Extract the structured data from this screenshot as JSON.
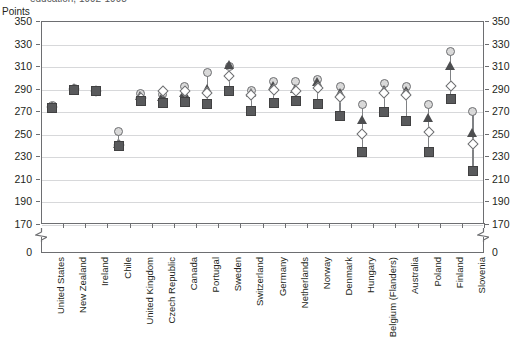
{
  "title": "education, 1992-1998",
  "axis_unit_label": "Points",
  "chart_data": {
    "type": "scatter",
    "title": "education, 1992-1998",
    "subtitle": "",
    "xlabel": "",
    "ylabel": "Points",
    "ylim": [
      170,
      350
    ],
    "yticks": [
      350,
      330,
      310,
      290,
      270,
      250,
      230,
      210,
      190,
      170
    ],
    "y_axis_break": true,
    "y_axis_zero_label": "0",
    "grid": true,
    "legend_position": "none",
    "right_axis_mirrored": true,
    "marker_styles": [
      "circle",
      "triangle",
      "diamond",
      "square"
    ],
    "categories": [
      "United States",
      "New Zealand",
      "Ireland",
      "Chile",
      "United Kingdom",
      "Czech Republic",
      "Canada",
      "Portugal",
      "Sweden",
      "Switzerland",
      "Germany",
      "Netherlands",
      "Norway",
      "Denmark",
      "Hungary",
      "Belgium (Flanders)",
      "Australia",
      "Poland",
      "Finland",
      "Slovenia"
    ],
    "series": [
      {
        "name": "Series 1",
        "marker": "circle",
        "values": [
          275,
          290,
          288,
          252,
          286,
          285,
          292,
          304,
          310,
          288,
          296,
          296,
          298,
          292,
          276,
          295,
          292,
          276,
          323,
          270
        ]
      },
      {
        "name": "Series 2",
        "marker": "triangle",
        "values": [
          274,
          290,
          288,
          241,
          284,
          283,
          286,
          290,
          311,
          286,
          293,
          290,
          296,
          286,
          262,
          289,
          288,
          264,
          310,
          251
        ]
      },
      {
        "name": "Series 3",
        "marker": "diamond",
        "values": [
          274,
          290,
          288,
          240,
          282,
          288,
          288,
          286,
          301,
          284,
          289,
          288,
          291,
          283,
          250,
          286,
          284,
          252,
          292,
          241
        ]
      },
      {
        "name": "Series 4",
        "marker": "square",
        "values": [
          273,
          289,
          288,
          239,
          279,
          277,
          278,
          276,
          288,
          270,
          277,
          279,
          276,
          266,
          234,
          269,
          261,
          234,
          281,
          217
        ]
      }
    ]
  }
}
